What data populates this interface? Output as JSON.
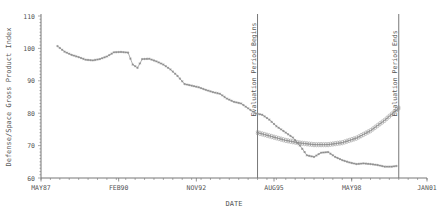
{
  "chart_data": {
    "type": "line",
    "title": "",
    "xlabel": "DATE",
    "ylabel": "Defense/Space Gross Product Index",
    "ylim": [
      60,
      110
    ],
    "yticks": [
      60,
      70,
      80,
      90,
      100,
      110
    ],
    "xticks": [
      "MAY87",
      "FEB90",
      "NOV92",
      "AUG95",
      "MAY98",
      "JAN01"
    ],
    "grid": false,
    "legend": null,
    "annotations": [
      {
        "text": "Evaluation Period Begins",
        "x": "JAN95"
      },
      {
        "text": "Evaluation Period Ends",
        "x": "JAN00"
      }
    ],
    "series": [
      {
        "name": "Actual",
        "marker": "star",
        "points": [
          [
            "DEC87",
            100.7
          ],
          [
            "MAR88",
            99.0
          ],
          [
            "JUN88",
            98.0
          ],
          [
            "SEP88",
            97.3
          ],
          [
            "DEC88",
            96.5
          ],
          [
            "MAR89",
            96.3
          ],
          [
            "JUN89",
            96.7
          ],
          [
            "SEP89",
            97.5
          ],
          [
            "DEC89",
            98.8
          ],
          [
            "MAR90",
            98.9
          ],
          [
            "JUN90",
            98.7
          ],
          [
            "AUG90",
            95.0
          ],
          [
            "OCT90",
            94.0
          ],
          [
            "DEC90",
            96.7
          ],
          [
            "MAR91",
            96.8
          ],
          [
            "JUN91",
            96.0
          ],
          [
            "SEP91",
            95.0
          ],
          [
            "DEC91",
            93.5
          ],
          [
            "MAR92",
            91.5
          ],
          [
            "JUN92",
            89.0
          ],
          [
            "SEP92",
            88.5
          ],
          [
            "DEC92",
            88.0
          ],
          [
            "MAR93",
            87.2
          ],
          [
            "JUN93",
            86.5
          ],
          [
            "SEP93",
            86.0
          ],
          [
            "DEC93",
            84.5
          ],
          [
            "MAR94",
            83.5
          ],
          [
            "JUN94",
            83.0
          ],
          [
            "SEP94",
            81.5
          ],
          [
            "DEC94",
            80.0
          ],
          [
            "MAR95",
            79.5
          ],
          [
            "JUN95",
            78.0
          ],
          [
            "SEP95",
            76.0
          ],
          [
            "DEC95",
            74.5
          ],
          [
            "JAN96",
            74.0
          ],
          [
            "APR96",
            72.5
          ],
          [
            "JUL96",
            70.0
          ],
          [
            "OCT96",
            67.0
          ],
          [
            "JAN97",
            66.5
          ],
          [
            "APR97",
            67.8
          ],
          [
            "JUL97",
            68.0
          ],
          [
            "OCT97",
            66.5
          ],
          [
            "JAN98",
            65.5
          ],
          [
            "APR98",
            64.8
          ],
          [
            "JUL98",
            64.3
          ],
          [
            "OCT98",
            64.5
          ],
          [
            "JAN99",
            64.3
          ],
          [
            "APR99",
            64.0
          ],
          [
            "JUL99",
            63.5
          ],
          [
            "OCT99",
            63.5
          ],
          [
            "DEC99",
            63.7
          ]
        ]
      },
      {
        "name": "Forecast",
        "marker": "circle",
        "points": [
          [
            "JAN95",
            74.0
          ],
          [
            "JUL95",
            72.8
          ],
          [
            "JAN96",
            71.6
          ],
          [
            "JUL96",
            70.8
          ],
          [
            "JAN97",
            70.3
          ],
          [
            "JUL97",
            70.3
          ],
          [
            "JAN98",
            70.9
          ],
          [
            "JUL98",
            72.3
          ],
          [
            "JAN99",
            74.6
          ],
          [
            "JUL99",
            77.8
          ],
          [
            "JAN00",
            81.6
          ]
        ]
      }
    ]
  }
}
